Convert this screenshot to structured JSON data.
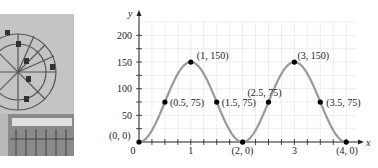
{
  "photo": {
    "subject": "ferris-wheel-photo"
  },
  "chart_data": {
    "type": "line",
    "title": "",
    "xlabel": "x",
    "ylabel": "y",
    "xlim": [
      0,
      4.2
    ],
    "ylim": [
      0,
      225
    ],
    "grid": true,
    "x_ticks": [
      0,
      1,
      3
    ],
    "x_tick_labels": [
      "0",
      "1",
      "3"
    ],
    "y_ticks": [
      50,
      100,
      150,
      200
    ],
    "y_tick_labels": [
      "50",
      "100",
      "150",
      "200"
    ],
    "curve": "y = 75 - 75cos(pi x)",
    "points": [
      {
        "x": 0,
        "y": 0,
        "label": "(0, 0)"
      },
      {
        "x": 0.5,
        "y": 75,
        "label": "(0.5, 75)"
      },
      {
        "x": 1,
        "y": 150,
        "label": "(1, 150)"
      },
      {
        "x": 1.5,
        "y": 75,
        "label": "(1.5, 75)"
      },
      {
        "x": 2,
        "y": 0,
        "label": "(2, 0)"
      },
      {
        "x": 2.5,
        "y": 75,
        "label": "(2.5, 75)"
      },
      {
        "x": 3,
        "y": 150,
        "label": "(3, 150)"
      },
      {
        "x": 3.5,
        "y": 75,
        "label": "(3.5, 75)"
      },
      {
        "x": 4,
        "y": 0,
        "label": "(4, 0)"
      }
    ],
    "colors": {
      "curve": "#9a9a9a",
      "points": "#000000",
      "grid": "#e6e6e6",
      "axis": "#222222"
    }
  }
}
